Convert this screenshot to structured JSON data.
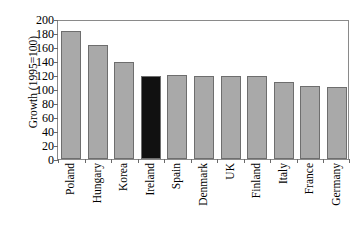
{
  "chart_data": {
    "type": "bar",
    "title": "",
    "subtitle": "",
    "xlabel": "",
    "ylabel": "Growth (1995=100)",
    "categories": [
      "Poland",
      "Hungary",
      "Korea",
      "Ireland",
      "Spain",
      "Denmark",
      "UK",
      "Finland",
      "Italy",
      "France",
      "Germany"
    ],
    "values": [
      183,
      163,
      139,
      119,
      120,
      119,
      119,
      118,
      110,
      105,
      103
    ],
    "ylim": [
      0,
      200
    ],
    "ytick_values": [
      0,
      20,
      40,
      60,
      80,
      100,
      120,
      140,
      160,
      180,
      200
    ],
    "ytick_labels": [
      "0",
      "20",
      "40",
      "60",
      "80",
      "100",
      "120",
      "140",
      "160",
      "180",
      "200"
    ],
    "grid": false,
    "legend": null,
    "legend_position": "none",
    "series": [
      {
        "name": "Growth",
        "values": [
          183,
          163,
          139,
          119,
          120,
          119,
          119,
          118,
          110,
          105,
          103
        ]
      }
    ],
    "bar_colors": [
      "#a9a9a9",
      "#a9a9a9",
      "#a9a9a9",
      "#111111",
      "#a9a9a9",
      "#a9a9a9",
      "#a9a9a9",
      "#a9a9a9",
      "#a9a9a9",
      "#a9a9a9",
      "#a9a9a9"
    ],
    "highlight_category": "Ireland",
    "colors": {
      "bar_fill": "#a9a9a9",
      "bar_highlight": "#111111",
      "bar_edge": "#6e6e6e",
      "axis": "#8a8a8a",
      "text": "#000000",
      "background": "#ffffff"
    }
  }
}
